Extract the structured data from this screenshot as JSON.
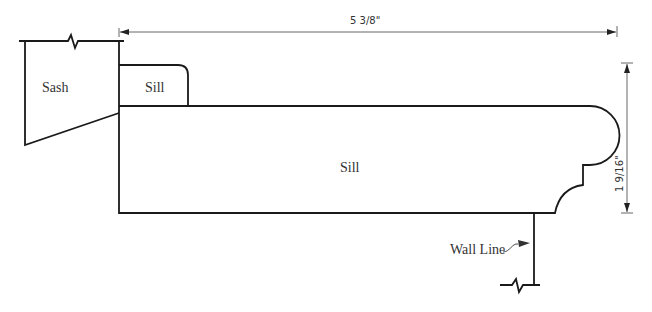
{
  "diagram": {
    "type": "window sill cross-section",
    "labels": {
      "sash": "Sash",
      "small_sill": "Sill",
      "main_sill": "Sill",
      "wall_line": "Wall Line"
    },
    "dimensions": {
      "width": "5 3/8\"",
      "height": "1 9/16\""
    },
    "colors": {
      "line": "#1a1a1a",
      "dimension_line": "#555555",
      "text": "#333333",
      "background": "#ffffff"
    }
  }
}
